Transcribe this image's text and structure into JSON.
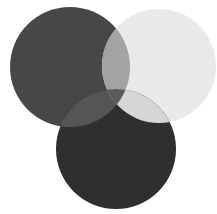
{
  "diagram": {
    "type": "venn",
    "circles": [
      {
        "id": "left",
        "cx": 70,
        "cy": 67,
        "r": 60,
        "color": "#474747"
      },
      {
        "id": "right",
        "cx": 159,
        "cy": 66,
        "r": 57,
        "color": "#e9e9e9"
      },
      {
        "id": "bottom",
        "cx": 116,
        "cy": 149,
        "r": 60,
        "color": "#2f2f2f"
      }
    ],
    "overlaps": {
      "left_right": "#a3a3a3",
      "left_bottom": "#555555",
      "right_bottom": "#d6d6d6",
      "all_three": "#5a5a5a"
    },
    "background": "#ffffff"
  }
}
